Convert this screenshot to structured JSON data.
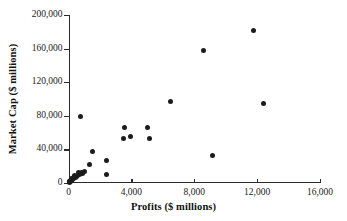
{
  "chart_data": {
    "type": "scatter",
    "title": "",
    "xlabel": "Profits ($ millions)",
    "ylabel": "Market Cap ($ millions)",
    "xlim": [
      0,
      16000
    ],
    "ylim": [
      0,
      200000
    ],
    "grid": false,
    "legend": null,
    "xticks": [
      0,
      4000,
      8000,
      12000,
      16000
    ],
    "xtick_labels": [
      "0",
      "4,000",
      "8,000",
      "12,000",
      "16,000"
    ],
    "yticks": [
      0,
      40000,
      80000,
      120000,
      160000,
      200000
    ],
    "ytick_labels": [
      "0",
      "40,000",
      "80,000",
      "120,000",
      "160,000",
      "200,000"
    ],
    "marker": "filled-circle",
    "marker_color": "#1c1c1c",
    "points": [
      {
        "x": 11800,
        "y": 182000
      },
      {
        "x": 8600,
        "y": 158000
      },
      {
        "x": 6500,
        "y": 97000
      },
      {
        "x": 12400,
        "y": 95000
      },
      {
        "x": 750,
        "y": 79000
      },
      {
        "x": 3550,
        "y": 66000
      },
      {
        "x": 5050,
        "y": 66000
      },
      {
        "x": 3950,
        "y": 55000
      },
      {
        "x": 3500,
        "y": 53000
      },
      {
        "x": 5150,
        "y": 53000
      },
      {
        "x": 9150,
        "y": 33000
      },
      {
        "x": 1550,
        "y": 37000
      },
      {
        "x": 1350,
        "y": 22000
      },
      {
        "x": 2400,
        "y": 26500
      },
      {
        "x": 2400,
        "y": 10000
      },
      {
        "x": 1000,
        "y": 13500
      },
      {
        "x": 800,
        "y": 12500
      },
      {
        "x": 700,
        "y": 10500
      },
      {
        "x": 620,
        "y": 12000
      },
      {
        "x": 560,
        "y": 9500
      },
      {
        "x": 500,
        "y": 8000
      },
      {
        "x": 430,
        "y": 6500
      },
      {
        "x": 380,
        "y": 9000
      },
      {
        "x": 340,
        "y": 5000
      },
      {
        "x": 300,
        "y": 7000
      },
      {
        "x": 260,
        "y": 4000
      },
      {
        "x": 220,
        "y": 5500
      },
      {
        "x": 190,
        "y": 2500
      },
      {
        "x": 150,
        "y": 3500
      },
      {
        "x": 120,
        "y": 1500
      },
      {
        "x": 90,
        "y": 2200
      },
      {
        "x": 60,
        "y": 900
      },
      {
        "x": 40,
        "y": 1800
      },
      {
        "x": 900,
        "y": 11000
      }
    ]
  }
}
